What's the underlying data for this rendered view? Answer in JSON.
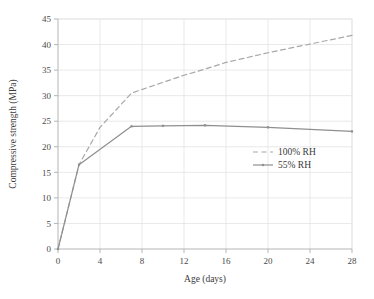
{
  "chart_data": {
    "type": "line",
    "title": "",
    "xlabel": "Age (days)",
    "ylabel": "Compressive strength (MPa)",
    "xlim": [
      0,
      28
    ],
    "ylim": [
      0,
      45
    ],
    "xticks": [
      0,
      4,
      8,
      12,
      16,
      20,
      24,
      28
    ],
    "yticks": [
      0,
      5,
      10,
      15,
      20,
      25,
      30,
      35,
      40,
      45
    ],
    "xtick_labels": [
      "0",
      "4",
      "8",
      "12",
      "16",
      "20",
      "24",
      "28"
    ],
    "ytick_labels": [
      "0",
      "5",
      "10",
      "15",
      "20",
      "25",
      "30",
      "35",
      "40",
      "45"
    ],
    "grid": true,
    "grid_color": "#e3e3e3",
    "axis_color": "#b5b5b5",
    "legend_position": "center-right-inside",
    "series": [
      {
        "name": "100% RH",
        "style": "dashed",
        "color": "#a8a8a8",
        "marker": "none",
        "x": [
          0,
          2,
          4,
          7,
          10,
          12,
          14,
          16,
          20,
          24,
          28
        ],
        "values": [
          0,
          16.5,
          23.8,
          30.5,
          32.6,
          34.0,
          35.2,
          36.5,
          38.4,
          40.1,
          41.8
        ]
      },
      {
        "name": "55% RH",
        "style": "solid",
        "color": "#8f8f8f",
        "marker": "dot",
        "x": [
          0,
          2,
          7,
          10,
          14,
          20,
          28
        ],
        "values": [
          0,
          16.5,
          24.0,
          24.1,
          24.2,
          23.8,
          23.0
        ]
      }
    ],
    "legend_entries": [
      "100% RH",
      "55% RH"
    ]
  },
  "legend": {
    "items": [
      {
        "label": "100% RH"
      },
      {
        "label": "55% RH"
      }
    ]
  },
  "axes": {
    "x_title": "Age (days)",
    "y_title": "Compressive strength (MPa)"
  }
}
